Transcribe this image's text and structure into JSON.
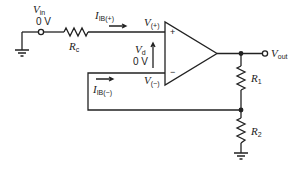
{
  "diagram": {
    "type": "non-inverting op-amp with bias currents",
    "labels": {
      "vin": {
        "main": "V",
        "sub": "in",
        "value": "0 V"
      },
      "rc": {
        "main": "R",
        "sub": "c"
      },
      "ib_plus": {
        "main": "I",
        "sub": "IB(+)"
      },
      "ib_minus": {
        "main": "I",
        "sub": "IB(−)"
      },
      "v_plus": {
        "main": "V",
        "sub": "(+)"
      },
      "v_minus": {
        "main": "V",
        "sub": "(−)"
      },
      "vd": {
        "main": "V",
        "sub": "d",
        "value": "0 V"
      },
      "vout": {
        "main": "V",
        "sub": "out"
      },
      "r1": {
        "main": "R",
        "sub": "1"
      },
      "r2": {
        "main": "R",
        "sub": "2"
      },
      "plus_sign": "+",
      "minus_sign": "−"
    },
    "colors": {
      "line": "#222222",
      "background": "#ffffff"
    }
  }
}
